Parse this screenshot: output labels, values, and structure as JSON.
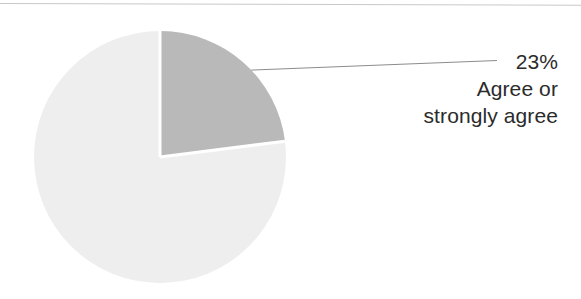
{
  "chart_data": {
    "type": "pie",
    "title": "",
    "subtitle": "",
    "xlabel": "",
    "ylabel": "",
    "legend_position": "none",
    "grid": false,
    "units": "percent",
    "start_angle_deg": 0,
    "direction": "clockwise",
    "categories": [
      "Agree or strongly agree",
      "Other"
    ],
    "values": [
      23,
      77
    ],
    "labels": [
      "23%",
      ""
    ],
    "colors": [
      "#b9b9b9",
      "#eeeeee"
    ],
    "separator_color": "#ffffff",
    "slices": [
      {
        "name": "Agree or strongly agree",
        "value": 23,
        "display_value": "23%",
        "color": "#b9b9b9",
        "labeled": true,
        "start_angle_deg": 0,
        "end_angle_deg": 82.8
      },
      {
        "name": "Other",
        "value": 77,
        "display_value": "",
        "color": "#eeeeee",
        "labeled": false,
        "start_angle_deg": 82.8,
        "end_angle_deg": 360
      }
    ],
    "annotations": [
      {
        "text_lines": [
          "23%",
          "Agree or",
          "strongly agree"
        ],
        "leader_line": true,
        "points_to_slice": "Agree or strongly agree"
      }
    ]
  },
  "callout": {
    "percent": "23%",
    "line2": "Agree or",
    "line3": "strongly agree"
  },
  "colors": {
    "slice_highlight": "#b9b9b9",
    "slice_remainder": "#eeeeee",
    "leader_line": "#8c8c8c",
    "top_rule": "#c9c9c9",
    "text": "#2b2b2b",
    "background": "#ffffff"
  },
  "geometry": {
    "pie_center_x": 160,
    "pie_center_y": 157,
    "pie_radius": 126
  }
}
